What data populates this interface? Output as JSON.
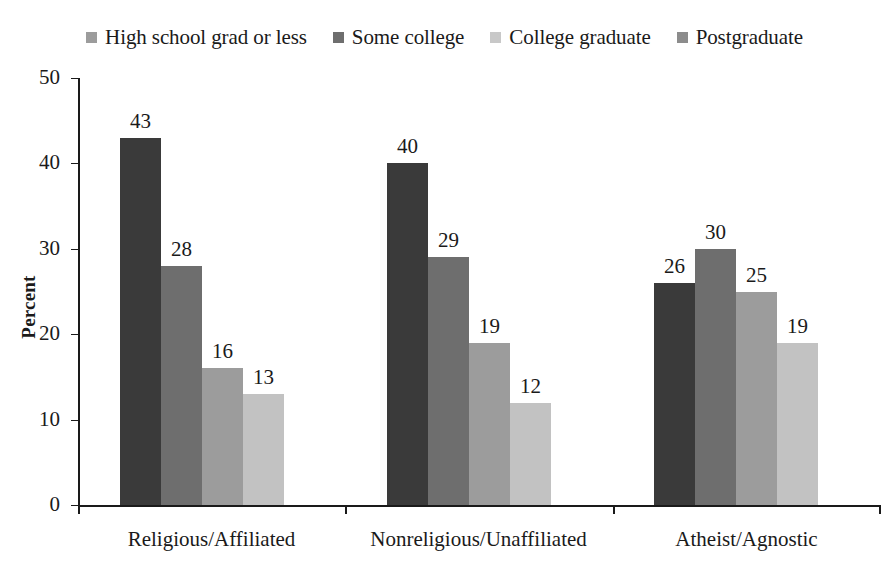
{
  "chart_data": {
    "type": "bar",
    "title": "",
    "xlabel": "",
    "ylabel": "Percent",
    "ylim": [
      0,
      50
    ],
    "yticks": [
      0,
      10,
      20,
      30,
      40,
      50
    ],
    "grid": false,
    "legend_position": "top",
    "categories": [
      "Religious/Affiliated",
      "Nonreligious/Unaffiliated",
      "Atheist/Agnostic"
    ],
    "series": [
      {
        "name": "High school grad or less",
        "color": "#3a3a3a",
        "values": [
          43,
          40,
          26
        ]
      },
      {
        "name": "Some college",
        "color": "#6e6e6e",
        "values": [
          28,
          29,
          30
        ]
      },
      {
        "name": "College graduate",
        "color": "#9c9c9c",
        "values": [
          16,
          19,
          25
        ]
      },
      {
        "name": "Postgraduate",
        "color": "#c2c2c2",
        "values": [
          13,
          12,
          19
        ]
      }
    ]
  },
  "legend": {
    "items": [
      {
        "label": "High school grad or less",
        "color": "#9c9c9c"
      },
      {
        "label": "Some college",
        "color": "#6e6e6e"
      },
      {
        "label": "College graduate",
        "color": "#c8c8c8"
      },
      {
        "label": "Postgraduate",
        "color": "#8c8c8c"
      }
    ]
  },
  "axis": {
    "y_tick_labels": [
      "50",
      "40",
      "30",
      "20",
      "10",
      "0"
    ],
    "y_axis_title": "Percent"
  }
}
